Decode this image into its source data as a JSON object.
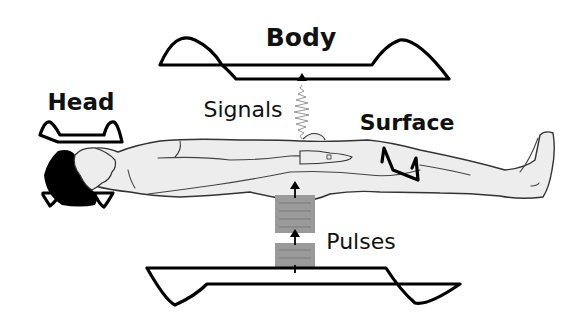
{
  "diagram": {
    "type": "MRI coil configuration schematic",
    "labels": {
      "body": "Body",
      "head": "Head",
      "signals": "Signals",
      "surface": "Surface",
      "pulses": "Pulses"
    },
    "components": [
      {
        "id": "body-coil-top",
        "label": "Body",
        "kind": "RF coil (transmit/receive) above patient"
      },
      {
        "id": "body-coil-bottom",
        "label": "",
        "kind": "RF coil below patient"
      },
      {
        "id": "head-coil",
        "label": "Head",
        "kind": "RF coil around head"
      },
      {
        "id": "surface-coil",
        "label": "Surface",
        "kind": "RF coil on thigh surface"
      },
      {
        "id": "patient",
        "label": "",
        "kind": "supine patient figure"
      }
    ],
    "flows": [
      {
        "from": "body-coil-bottom",
        "to": "patient",
        "label": "Pulses",
        "direction": "up"
      },
      {
        "from": "patient",
        "to": "body-coil-top",
        "label": "Signals",
        "direction": "up"
      }
    ],
    "colors": {
      "line": "#000000",
      "body_fill": "#ededed",
      "pulse_block": "#9a9a9a",
      "background": "#ffffff"
    }
  }
}
